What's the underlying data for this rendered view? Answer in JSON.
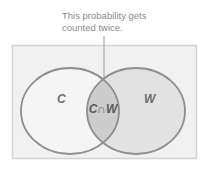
{
  "annotation": {
    "line1": "This probability gets",
    "line2": "counted twice."
  },
  "sets": {
    "left": {
      "label": "C"
    },
    "right": {
      "label": "W"
    },
    "intersection": {
      "label": "C∩W"
    }
  },
  "colors": {
    "box_fill": "#f1f1f1",
    "box_stroke": "#cfcfcf",
    "left_fill": "#f4f4f4",
    "right_fill": "#e3e3e3",
    "intersection_fill": "#cfcfcf",
    "outline": "#8c8c8c",
    "text": "#8a8a8a"
  }
}
